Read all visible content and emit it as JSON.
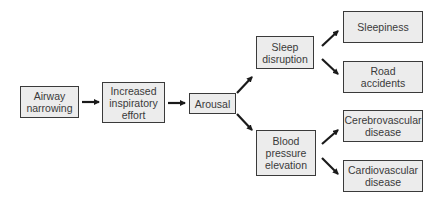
{
  "diagram": {
    "type": "flowchart",
    "colors": {
      "box_fill": "#ececec",
      "box_border": "#3a3a3a",
      "text": "#3a3a3a",
      "arrow": "#1a1a1a"
    },
    "nodes": {
      "airway_narrowing": {
        "label": "Airway\nnarrowing"
      },
      "increased_inspiratory_effort": {
        "label": "Increased\ninspiratory\neffort"
      },
      "arousal": {
        "label": "Arousal"
      },
      "sleep_disruption": {
        "label": "Sleep\ndisruption"
      },
      "blood_pressure_elevation": {
        "label": "Blood\npressure\nelevation"
      },
      "sleepiness": {
        "label": "Sleepiness"
      },
      "road_accidents": {
        "label": "Road\naccidents"
      },
      "cerebrovascular_disease": {
        "label": "Cerebrovascular\ndisease"
      },
      "cardiovascular_disease": {
        "label": "Cardiovascular\ndisease"
      }
    },
    "edges": [
      {
        "from": "airway_narrowing",
        "to": "increased_inspiratory_effort"
      },
      {
        "from": "increased_inspiratory_effort",
        "to": "arousal"
      },
      {
        "from": "arousal",
        "to": "sleep_disruption"
      },
      {
        "from": "arousal",
        "to": "blood_pressure_elevation"
      },
      {
        "from": "sleep_disruption",
        "to": "sleepiness"
      },
      {
        "from": "sleep_disruption",
        "to": "road_accidents"
      },
      {
        "from": "blood_pressure_elevation",
        "to": "cerebrovascular_disease"
      },
      {
        "from": "blood_pressure_elevation",
        "to": "cardiovascular_disease"
      }
    ]
  }
}
